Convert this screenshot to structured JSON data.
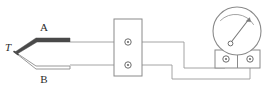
{
  "figure": {
    "type": "thermocouple-measurement-circuit-diagram",
    "width": 271,
    "height": 91,
    "background_color": "#ffffff"
  },
  "labels": {
    "junction": "T",
    "wire_a": "A",
    "wire_b": "B"
  },
  "colors": {
    "wire_a_fill": "#4a4a4a",
    "wire_b_stroke": "#8c8c8c",
    "lead_stroke": "#9a9a9a",
    "outline_stroke": "#8a8a8a",
    "meter_stroke": "#8a8a8a",
    "needle_stroke": "#7a7a7a",
    "text": "#2b2b2b"
  },
  "components": {
    "thermocouple": {
      "name": "thermocouple-probe",
      "junction_label": "T",
      "upper_element_label": "A",
      "lower_element_label": "B"
    },
    "terminal_block": {
      "name": "terminal-block",
      "terminal_count": 2,
      "x": 114,
      "y": 19,
      "width": 28,
      "height": 57
    },
    "meter": {
      "name": "analog-meter",
      "dial_center_x": 237,
      "dial_center_y": 31,
      "dial_radius": 24,
      "terminal_count": 2,
      "needle_angle_deg": -62
    }
  },
  "wiring": {
    "upper_lead_label": "A-lead",
    "lower_lead_label": "B-lead",
    "meter_left_terminal": "meter-terminal-left",
    "meter_right_terminal": "meter-terminal-right"
  }
}
